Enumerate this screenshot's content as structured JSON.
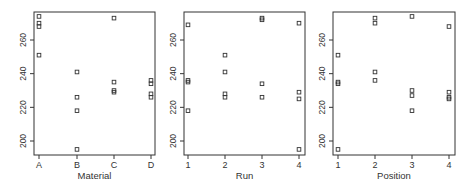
{
  "chart_data": [
    {
      "type": "scatter",
      "title": "",
      "xlabel": "Material",
      "ylabel": "",
      "categories": [
        "A",
        "B",
        "C",
        "D"
      ],
      "yticks": [
        200,
        220,
        240,
        260
      ],
      "ylim": [
        191,
        276
      ],
      "grid": false,
      "legend": null,
      "points": [
        {
          "x": "A",
          "y": 274
        },
        {
          "x": "A",
          "y": 270
        },
        {
          "x": "A",
          "y": 268
        },
        {
          "x": "A",
          "y": 251
        },
        {
          "x": "B",
          "y": 241
        },
        {
          "x": "B",
          "y": 226
        },
        {
          "x": "B",
          "y": 218
        },
        {
          "x": "B",
          "y": 195
        },
        {
          "x": "C",
          "y": 273
        },
        {
          "x": "C",
          "y": 235
        },
        {
          "x": "C",
          "y": 230
        },
        {
          "x": "C",
          "y": 229
        },
        {
          "x": "D",
          "y": 236
        },
        {
          "x": "D",
          "y": 234
        },
        {
          "x": "D",
          "y": 228
        },
        {
          "x": "D",
          "y": 226
        }
      ]
    },
    {
      "type": "scatter",
      "title": "",
      "xlabel": "Run",
      "ylabel": "",
      "categories": [
        "1",
        "2",
        "3",
        "4"
      ],
      "yticks": [
        200,
        220,
        240,
        260
      ],
      "ylim": [
        191,
        276
      ],
      "grid": false,
      "legend": null,
      "points": [
        {
          "x": "1",
          "y": 269
        },
        {
          "x": "1",
          "y": 236
        },
        {
          "x": "1",
          "y": 235
        },
        {
          "x": "1",
          "y": 218
        },
        {
          "x": "2",
          "y": 251
        },
        {
          "x": "2",
          "y": 241
        },
        {
          "x": "2",
          "y": 228
        },
        {
          "x": "2",
          "y": 226
        },
        {
          "x": "3",
          "y": 273
        },
        {
          "x": "3",
          "y": 272
        },
        {
          "x": "3",
          "y": 234
        },
        {
          "x": "3",
          "y": 226
        },
        {
          "x": "4",
          "y": 270
        },
        {
          "x": "4",
          "y": 229
        },
        {
          "x": "4",
          "y": 225
        },
        {
          "x": "4",
          "y": 195
        }
      ]
    },
    {
      "type": "scatter",
      "title": "",
      "xlabel": "Position",
      "ylabel": "",
      "categories": [
        "1",
        "2",
        "3",
        "4"
      ],
      "yticks": [
        200,
        220,
        240,
        260
      ],
      "ylim": [
        191,
        276
      ],
      "grid": false,
      "legend": null,
      "points": [
        {
          "x": "1",
          "y": 251
        },
        {
          "x": "1",
          "y": 235
        },
        {
          "x": "1",
          "y": 234
        },
        {
          "x": "1",
          "y": 195
        },
        {
          "x": "2",
          "y": 273
        },
        {
          "x": "2",
          "y": 270
        },
        {
          "x": "2",
          "y": 241
        },
        {
          "x": "2",
          "y": 236
        },
        {
          "x": "3",
          "y": 274
        },
        {
          "x": "3",
          "y": 230
        },
        {
          "x": "3",
          "y": 227
        },
        {
          "x": "3",
          "y": 218
        },
        {
          "x": "4",
          "y": 268
        },
        {
          "x": "4",
          "y": 229
        },
        {
          "x": "4",
          "y": 226
        },
        {
          "x": "4",
          "y": 225
        }
      ]
    }
  ],
  "panels": [
    {
      "xlabel": "Material",
      "frame": {
        "left": 34,
        "right": 155,
        "top": 12,
        "bottom": 155
      },
      "xticks_px": [
        39,
        77,
        114,
        151
      ]
    },
    {
      "xlabel": "Run",
      "frame": {
        "left": 184,
        "right": 305,
        "top": 12,
        "bottom": 155
      },
      "xticks_px": [
        188,
        225,
        262,
        299
      ]
    },
    {
      "xlabel": "Position",
      "frame": {
        "left": 333,
        "right": 455,
        "top": 12,
        "bottom": 155
      },
      "xticks_px": [
        338,
        375,
        412,
        449
      ]
    }
  ],
  "colors": {
    "axis": "#333333",
    "marker": "#333333",
    "background": "#ffffff"
  }
}
